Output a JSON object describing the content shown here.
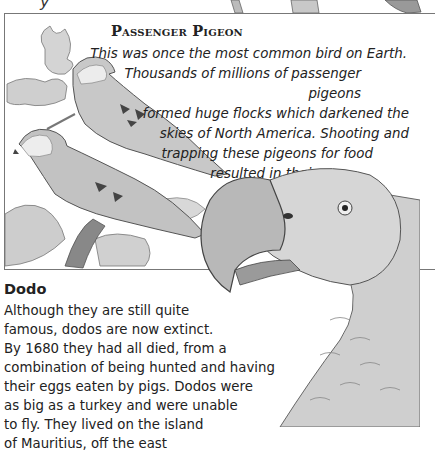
{
  "top_fragment": "y",
  "passenger_pigeon": {
    "title": "Passenger Pigeon",
    "lines": [
      "This was once the most common bird on Earth.",
      "Thousands of millions of passenger pigeons",
      "formed huge flocks which darkened the",
      "skies of North America. Shooting and",
      "trapping these pigeons for food",
      "resulted in their",
      "extinction",
      "in 1914."
    ],
    "illustration": "two passenger pigeons perched on an oak branch"
  },
  "dodo": {
    "title": "Dodo",
    "lines": [
      "Although they are still quite",
      "famous, dodos are now extinct.",
      "By 1680 they had all died, from a",
      "combination of being hunted and having",
      "their eggs eaten by pigs. Dodos were",
      "as big as a turkey and were unable",
      "to fly. They lived on the island",
      "of Mauritius, off the east"
    ],
    "illustration": "dodo head and neck"
  }
}
